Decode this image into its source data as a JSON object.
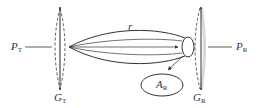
{
  "diagram": {
    "type": "antenna-link",
    "labels": {
      "p_t": {
        "main": "P",
        "sub": "T"
      },
      "g_t": {
        "main": "G",
        "sub": "T"
      },
      "r": "r",
      "g_r": {
        "main": "G",
        "sub": "R"
      },
      "p_r": {
        "main": "P",
        "sub": "R"
      },
      "a_r": {
        "main": "A",
        "sub": "R"
      }
    },
    "colors": {
      "stroke": "#333333",
      "antenna_fill": "#d9d9d9"
    }
  }
}
